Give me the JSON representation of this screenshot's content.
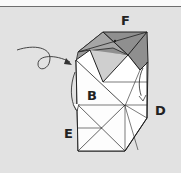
{
  "diagram": {
    "type": "origami-step",
    "labels": {
      "F": "F",
      "B": "B",
      "D": "D",
      "E": "E"
    },
    "colors": {
      "background": "#e2e2e2",
      "paper_white": "#ffffff",
      "paper_colored": "#8f8f8f",
      "paper_colored_light": "#a8a8a8",
      "line": "#222222"
    },
    "annotations": [
      {
        "kind": "looping-arrow",
        "direction": "into-left-pocket"
      },
      {
        "kind": "curved-arrow",
        "side": "left",
        "meaning": "fold-behind"
      },
      {
        "kind": "curved-arrow",
        "side": "right",
        "meaning": "fold-behind"
      }
    ]
  }
}
